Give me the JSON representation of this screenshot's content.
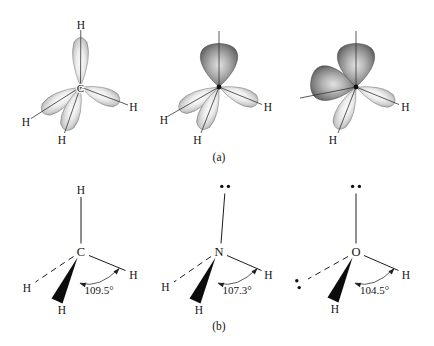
{
  "figure": {
    "panel_a": {
      "label": "(a)",
      "molecules": [
        {
          "name": "methane",
          "central_atom": "C",
          "hydrogen": "H",
          "bonding_orbitals": 4,
          "lone_pairs": 0
        },
        {
          "name": "ammonia",
          "central_atom": "N",
          "hydrogen": "H",
          "bonding_orbitals": 3,
          "lone_pairs": 1
        },
        {
          "name": "water",
          "central_atom": "O",
          "hydrogen": "H",
          "bonding_orbitals": 2,
          "lone_pairs": 2
        }
      ]
    },
    "panel_b": {
      "label": "(b)",
      "molecules": [
        {
          "name": "methane",
          "central_atom": "C",
          "hydrogen": "H",
          "bond_angle": "109.5°",
          "bond_angle_value": 109.5,
          "lone_pair_dot_groups": 0
        },
        {
          "name": "ammonia",
          "central_atom": "N",
          "hydrogen": "H",
          "bond_angle": "107.3°",
          "bond_angle_value": 107.3,
          "lone_pair_dot_groups": 1
        },
        {
          "name": "water",
          "central_atom": "O",
          "hydrogen": "H",
          "bond_angle": "104.5°",
          "bond_angle_value": 104.5,
          "lone_pair_dot_groups": 2
        }
      ]
    },
    "colors": {
      "bond_lobe_light": "#fbfbfb",
      "bond_lobe_dark": "#9b9b9b",
      "lone_lobe_light": "#e2e2e2",
      "lone_lobe_dark": "#4c4c4c",
      "ink": "#141414"
    }
  }
}
